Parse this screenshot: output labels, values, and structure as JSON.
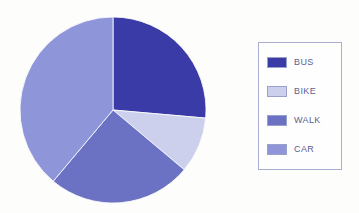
{
  "chart_data": {
    "type": "pie",
    "title": "",
    "subtitle": "",
    "xlabel": "",
    "ylabel": "",
    "grid": false,
    "legend_position": "right",
    "start_angle_deg": 0,
    "direction": "clockwise",
    "categories": [
      "BUS",
      "BIKE",
      "WALK",
      "CAR"
    ],
    "values": [
      26,
      10,
      25,
      39
    ],
    "unit": "percent",
    "slices": [
      {
        "label": "BUS",
        "value": 26,
        "color": "#3b3ba8",
        "start_angle_deg": 0,
        "end_angle_deg": 95
      },
      {
        "label": "BIKE",
        "value": 10,
        "color": "#ccd0ec",
        "start_angle_deg": 95,
        "end_angle_deg": 130
      },
      {
        "label": "WALK",
        "value": 25,
        "color": "#6b72c4",
        "start_angle_deg": 130,
        "end_angle_deg": 220
      },
      {
        "label": "CAR",
        "value": 39,
        "color": "#8e95d8",
        "start_angle_deg": 220,
        "end_angle_deg": 360
      }
    ],
    "geometry": {
      "center_x": 95,
      "center_y": 95,
      "radius": 93
    }
  },
  "legend": {
    "border_color": "#a9aed2",
    "text_color": "#5b5f93",
    "items": [
      {
        "label": "BUS",
        "color": "#3b3ba8"
      },
      {
        "label": "BIKE",
        "color": "#ccd0ec"
      },
      {
        "label": "WALK",
        "color": "#6b72c4"
      },
      {
        "label": "CAR",
        "color": "#8e95d8"
      }
    ]
  },
  "canvas": {
    "background": "#fdfdfb"
  }
}
